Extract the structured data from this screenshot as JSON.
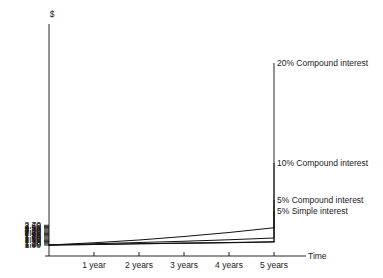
{
  "chart_data": {
    "type": "line",
    "title": "",
    "xlabel": "Time",
    "ylabel": "$",
    "x": [
      0,
      1,
      2,
      3,
      4,
      5
    ],
    "x_tick_labels": [
      "1 year",
      "2 years",
      "3 years",
      "4 years",
      "5 years"
    ],
    "x_tick_values": [
      1,
      2,
      3,
      4,
      5
    ],
    "xlim": [
      0,
      5.5
    ],
    "ylim": [
      1.0,
      2.75
    ],
    "y_tick_labels": [
      "2.70",
      "2.60",
      "2.50",
      "2.40",
      "2.30",
      "2.20",
      "2.10",
      "2.00",
      "1.90",
      "1.80",
      "1.70",
      "1.60",
      "1.50",
      "1.40",
      "1.30",
      "1.20",
      "1.10",
      "1.00"
    ],
    "y_tick_values": [
      2.7,
      2.6,
      2.5,
      2.4,
      2.3,
      2.2,
      2.1,
      2.0,
      1.9,
      1.8,
      1.7,
      1.6,
      1.5,
      1.4,
      1.3,
      1.2,
      1.1,
      1.0
    ],
    "grid": false,
    "legend_position": "right-inline-labels",
    "line_color": "#111111",
    "series": [
      {
        "name": "20% Compound interest",
        "label": "20% Compound interest",
        "values": [
          1.0,
          1.2,
          1.44,
          1.73,
          2.07,
          2.49
        ]
      },
      {
        "name": "10% Compound interest",
        "label": "10% Compound interest",
        "values": [
          1.0,
          1.1,
          1.21,
          1.33,
          1.46,
          1.61
        ]
      },
      {
        "name": "5% Compound interest",
        "label": "5% Compound interest",
        "values": [
          1.0,
          1.05,
          1.1,
          1.16,
          1.22,
          1.28
        ]
      },
      {
        "name": "5% Simple interest",
        "label": "5% Simple interest",
        "values": [
          1.0,
          1.05,
          1.1,
          1.15,
          1.2,
          1.25
        ]
      }
    ]
  },
  "axes": {
    "y_axis_title": "$",
    "x_axis_title": "Time"
  }
}
